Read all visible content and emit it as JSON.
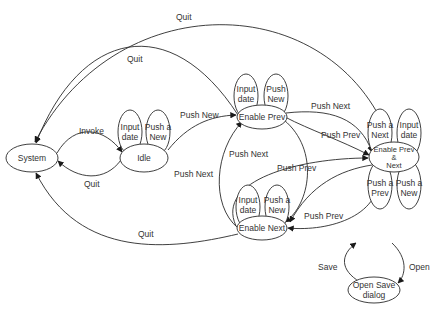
{
  "diagram": {
    "type": "state-machine",
    "nodes": {
      "system": "System",
      "idle": "Idle",
      "enable_prev": "Enable Prev",
      "enable_next": "Enable Next",
      "enable_both_1": "Enable Prev",
      "enable_both_2": "&",
      "enable_both_3": "Next",
      "open_save_1": "Open Save",
      "open_save_2": "dialog"
    },
    "self_loops": {
      "idle_input_1": "Input",
      "idle_input_2": "date",
      "idle_push_1": "Push a",
      "idle_push_2": "New",
      "prev_input_1": "Input",
      "prev_input_2": "date",
      "prev_push_1": "Push",
      "prev_push_2": "New",
      "next_input_1": "Input",
      "next_input_2": "date",
      "next_push_1": "Push a",
      "next_push_2": "New",
      "both_pushnext_1": "Push a",
      "both_pushnext_2": "Next",
      "both_input_1": "Input",
      "both_input_2": "date",
      "both_pushprev_1": "Push a",
      "both_pushprev_2": "Prev",
      "both_pushnew_1": "Push a",
      "both_pushnew_2": "New"
    },
    "edges": {
      "quit_top": "Quit",
      "quit_second": "Quit",
      "invoke": "Invoke",
      "quit_idle": "Quit",
      "push_new": "Push New",
      "push_next_top": "Push Next",
      "push_prev_mid": "Push Prev",
      "push_next_left": "Push Next",
      "push_next_center": "Push Next",
      "push_prev_center": "Push Prev",
      "push_prev_low": "Push Prev",
      "quit_bottom": "Quit",
      "save": "Save",
      "open": "Open"
    }
  }
}
